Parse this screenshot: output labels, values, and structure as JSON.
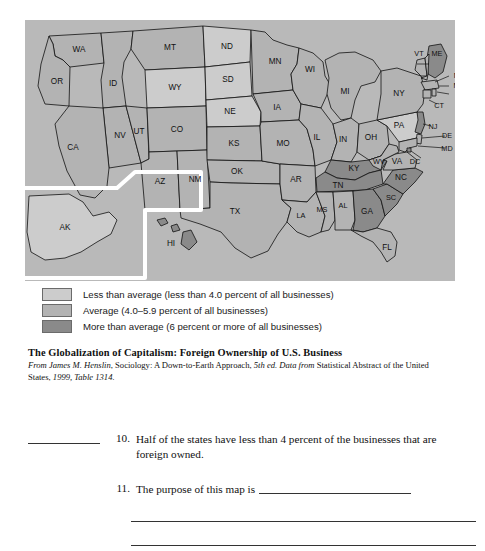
{
  "map": {
    "title": "Foreign Ownership of U.S. Business by State",
    "background_color": "#b9b9b9",
    "categories": {
      "low": {
        "label": "Less than average (less than 4.0 percent of all businesses)",
        "color": "#cccccc"
      },
      "mid": {
        "label": "Average (4.0–5.9 percent of all businesses)",
        "color": "#b3b3b3"
      },
      "high": {
        "label": "More than average (6 percent or more of all businesses)",
        "color": "#8a8a8a"
      }
    },
    "states": [
      {
        "code": "WA",
        "category": "mid"
      },
      {
        "code": "OR",
        "category": "mid"
      },
      {
        "code": "ID",
        "category": "mid"
      },
      {
        "code": "MT",
        "category": "mid"
      },
      {
        "code": "WY",
        "category": "low"
      },
      {
        "code": "NV",
        "category": "mid"
      },
      {
        "code": "UT",
        "category": "mid"
      },
      {
        "code": "CA",
        "category": "mid"
      },
      {
        "code": "CO",
        "category": "mid"
      },
      {
        "code": "AZ",
        "category": "mid"
      },
      {
        "code": "NM",
        "category": "mid"
      },
      {
        "code": "ND",
        "category": "low"
      },
      {
        "code": "SD",
        "category": "low"
      },
      {
        "code": "NE",
        "category": "low"
      },
      {
        "code": "KS",
        "category": "mid"
      },
      {
        "code": "OK",
        "category": "mid"
      },
      {
        "code": "TX",
        "category": "mid"
      },
      {
        "code": "MN",
        "category": "mid"
      },
      {
        "code": "IA",
        "category": "mid"
      },
      {
        "code": "MO",
        "category": "mid"
      },
      {
        "code": "AR",
        "category": "mid"
      },
      {
        "code": "LA",
        "category": "mid"
      },
      {
        "code": "WI",
        "category": "mid"
      },
      {
        "code": "IL",
        "category": "mid"
      },
      {
        "code": "MI",
        "category": "mid"
      },
      {
        "code": "IN",
        "category": "mid"
      },
      {
        "code": "OH",
        "category": "mid"
      },
      {
        "code": "KY",
        "category": "high"
      },
      {
        "code": "TN",
        "category": "high"
      },
      {
        "code": "MS",
        "category": "mid"
      },
      {
        "code": "AL",
        "category": "mid"
      },
      {
        "code": "GA",
        "category": "high"
      },
      {
        "code": "FL",
        "category": "mid"
      },
      {
        "code": "SC",
        "category": "high"
      },
      {
        "code": "NC",
        "category": "high"
      },
      {
        "code": "VA",
        "category": "mid"
      },
      {
        "code": "WV",
        "category": "mid"
      },
      {
        "code": "PA",
        "category": "low"
      },
      {
        "code": "NY",
        "category": "mid"
      },
      {
        "code": "VT",
        "category": "mid"
      },
      {
        "code": "ME",
        "category": "high"
      },
      {
        "code": "NH",
        "category": "mid"
      },
      {
        "code": "MA",
        "category": "mid"
      },
      {
        "code": "RI",
        "category": "mid"
      },
      {
        "code": "CT",
        "category": "mid"
      },
      {
        "code": "NJ",
        "category": "high"
      },
      {
        "code": "DE",
        "category": "mid"
      },
      {
        "code": "MD",
        "category": "mid"
      },
      {
        "code": "DC",
        "category": "mid"
      },
      {
        "code": "AK",
        "category": "low"
      },
      {
        "code": "HI",
        "category": "high"
      }
    ]
  },
  "legend": {
    "rows": [
      {
        "label": "Less than average (less than 4.0 percent of all businesses)",
        "color": "#cccccc"
      },
      {
        "label": "Average (4.0–5.9 percent of all businesses)",
        "color": "#b3b3b3"
      },
      {
        "label": "More than average (6 percent or more of all businesses)",
        "color": "#8a8a8a"
      }
    ]
  },
  "caption": {
    "title": "The Globalization of Capitalism: Foreign Ownership of U.S. Business",
    "source_from": "From",
    "source_author": "James M. Henslin",
    "source_work": ", Sociology: A Down-to-Earth Approach, ",
    "source_edition": "5th ed. Data from",
    "source_rest": " Statistical Abstract of the United States, ",
    "source_year": "1999, Table 1314."
  },
  "questions": [
    {
      "number": "10.",
      "text": "Half of the states have less than 4 percent of the businesses that are foreign owned.",
      "has_answer_blank": true
    },
    {
      "number": "11.",
      "text": "The purpose of this map is",
      "has_answer_blank": false
    }
  ]
}
